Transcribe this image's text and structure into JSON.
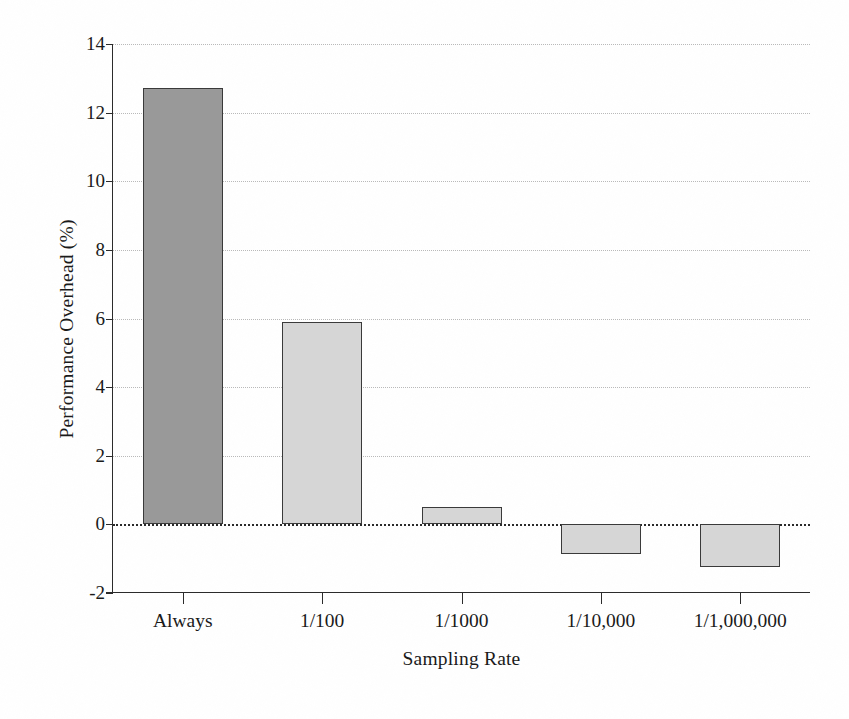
{
  "chart_data": {
    "type": "bar",
    "title": "",
    "xlabel": "Sampling Rate",
    "ylabel": "Performance Overhead (%)",
    "categories": [
      "Always",
      "1/100",
      "1/1000",
      "1/10,000",
      "1/1,000,000"
    ],
    "values": [
      12.72,
      5.9,
      0.52,
      -0.87,
      -1.25
    ],
    "ylim": [
      -2,
      14
    ],
    "yticks": [
      14,
      12,
      10,
      8,
      6,
      4,
      2,
      0,
      -2
    ],
    "ytick_labels": [
      "14",
      "12",
      "10",
      "8",
      "6",
      "4",
      "2",
      "0",
      "-2"
    ],
    "grid": true,
    "grid_axis": "y",
    "legend": "none",
    "bar_colors": [
      "#999999",
      "#d6d6d6",
      "#d6d6d6",
      "#d6d6d6",
      "#d6d6d6"
    ],
    "bar_edge_color": "#3a3a3a",
    "zero_line_color": "#2a2a2a",
    "gridline_color": "#b9b9b9",
    "axis_color": "#2b2b2b",
    "background_color": "#ffffff"
  }
}
